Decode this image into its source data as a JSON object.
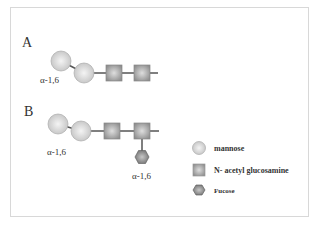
{
  "diagram": {
    "panels": [
      {
        "label": "A",
        "linkage_labels": [
          "α-1,6"
        ],
        "residues": [
          "mannose",
          "mannose",
          "N- acetyl glucosamine",
          "N- acetyl glucosamine"
        ]
      },
      {
        "label": "B",
        "linkage_labels": [
          "α-1,6",
          "α-1,6"
        ],
        "residues": [
          "mannose",
          "mannose",
          "N- acetyl glucosamine",
          "N- acetyl glucosamine",
          "Fucose"
        ]
      }
    ],
    "legend": [
      {
        "shape": "circle",
        "label": "mannose"
      },
      {
        "shape": "square",
        "label": "N- acetyl glucosamine"
      },
      {
        "shape": "hexagon",
        "label": "Fucose"
      }
    ],
    "colors": {
      "circle": "#d9d9d9",
      "square": "#a8a8a8",
      "hexagon": "#8c8c8c",
      "line": "#555555",
      "border": "#d8d8d8"
    }
  }
}
